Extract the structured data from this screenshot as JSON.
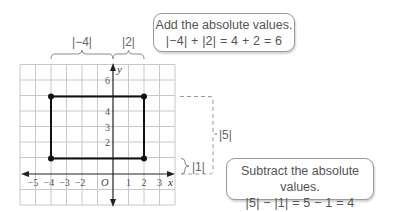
{
  "graph": {
    "x_axis_label": "x",
    "y_axis_label": "y",
    "origin_label": "O",
    "x_ticks": [
      {
        "value": -5,
        "label": "−5"
      },
      {
        "value": -4,
        "label": "−4"
      },
      {
        "value": -3,
        "label": "−3"
      },
      {
        "value": -2,
        "label": "−2"
      },
      {
        "value": 1,
        "label": "1"
      },
      {
        "value": 2,
        "label": "2"
      },
      {
        "value": 3,
        "label": "3"
      }
    ],
    "y_ticks": [
      {
        "value": 2,
        "label": "2"
      },
      {
        "value": 3,
        "label": "3"
      },
      {
        "value": 4,
        "label": "4"
      },
      {
        "value": 6,
        "label": "6"
      }
    ],
    "x_range": [
      -6,
      4
    ],
    "y_range": [
      -2,
      7
    ],
    "rectangle_vertices": [
      [
        -4,
        5
      ],
      [
        2,
        5
      ],
      [
        2,
        1
      ],
      [
        -4,
        1
      ]
    ]
  },
  "annotations": {
    "top_brace_left_label": "|−4|",
    "top_brace_right_label": "|2|",
    "right_brace_large_label": "|5|",
    "right_brace_small_label": "|1|"
  },
  "callouts": {
    "add": {
      "title": "Add the absolute values.",
      "equation": "|−4| + |2| = 4 + 2 = 6"
    },
    "subtract": {
      "title": "Subtract the absolute values.",
      "equation": "|5| − |1| = 5 − 1 = 4"
    }
  },
  "colors": {
    "grid": "#c8c8c8",
    "axis": "#222222",
    "rectangle": "#111111",
    "annotation": "#7a7a7a",
    "callout_border": "#9a9a9a"
  }
}
